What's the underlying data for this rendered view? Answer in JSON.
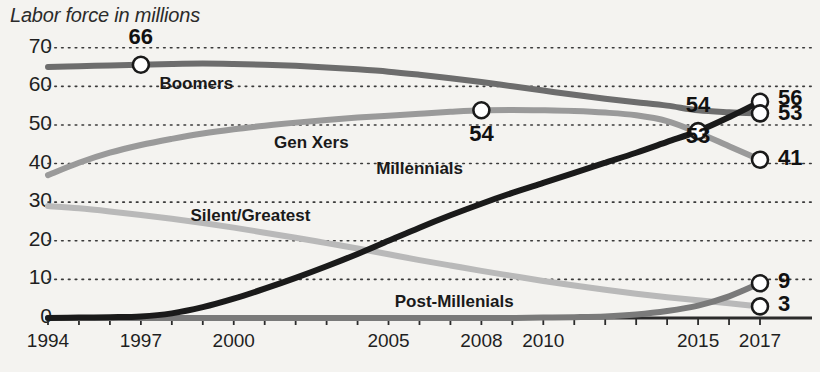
{
  "chart_data": {
    "type": "line",
    "title": "Labor force in millions",
    "xlabel": "",
    "ylabel": "",
    "xlim": [
      1994,
      2017
    ],
    "ylim": [
      0,
      72
    ],
    "grid": true,
    "grid_style": "dotted-horizontal",
    "legend": "inline-labels",
    "x": [
      1994,
      1995,
      1996,
      1997,
      1998,
      1999,
      2000,
      2001,
      2002,
      2003,
      2004,
      2005,
      2006,
      2007,
      2008,
      2009,
      2010,
      2011,
      2012,
      2013,
      2014,
      2015,
      2016,
      2017
    ],
    "x_tick_labels": [
      "1994",
      "1997",
      "2000",
      "2005",
      "2008",
      "2010",
      "2015",
      "2017"
    ],
    "x_tick_values": [
      1994,
      1997,
      2000,
      2005,
      2008,
      2010,
      2015,
      2017
    ],
    "y_tick_labels": [
      "0",
      "10",
      "20",
      "30",
      "40",
      "50",
      "60",
      "70"
    ],
    "y_tick_values": [
      0,
      10,
      20,
      30,
      40,
      50,
      60,
      70
    ],
    "series": [
      {
        "name": "Boomers",
        "color": "#6d6d6d",
        "label_x": 1997.6,
        "label_y": 60.5,
        "values": [
          65.0,
          65.2,
          65.4,
          65.6,
          65.8,
          65.9,
          65.8,
          65.6,
          65.3,
          64.9,
          64.4,
          63.8,
          63.0,
          62.1,
          61.1,
          60.0,
          58.9,
          57.8,
          56.8,
          55.9,
          55.0,
          53.8,
          53.3,
          53.0
        ]
      },
      {
        "name": "Gen Xers",
        "color": "#9a9a9a",
        "label_x": 2001.3,
        "label_y": 45.2,
        "values": [
          37.0,
          40.2,
          42.8,
          44.8,
          46.4,
          47.8,
          48.9,
          49.8,
          50.6,
          51.3,
          51.9,
          52.4,
          52.9,
          53.4,
          53.8,
          53.9,
          53.8,
          53.6,
          53.2,
          52.5,
          51.0,
          48.0,
          44.5,
          41.0
        ]
      },
      {
        "name": "Millennials",
        "color": "#1a1a1a",
        "label_x": 2004.6,
        "label_y": 38.5,
        "values": [
          0.0,
          0.1,
          0.2,
          0.4,
          1.2,
          2.8,
          5.0,
          7.6,
          10.4,
          13.4,
          16.6,
          20.0,
          23.4,
          26.6,
          29.6,
          32.4,
          35.0,
          37.6,
          40.2,
          42.8,
          45.6,
          48.4,
          52.0,
          56.0
        ]
      },
      {
        "name": "Silent/Greatest",
        "color": "#b9b9b9",
        "label_x": 1998.6,
        "label_y": 26.5,
        "values": [
          29.0,
          28.4,
          27.6,
          26.7,
          25.7,
          24.6,
          23.4,
          22.1,
          20.8,
          19.4,
          18.0,
          16.5,
          15.0,
          13.6,
          12.2,
          10.9,
          9.6,
          8.4,
          7.3,
          6.3,
          5.4,
          4.6,
          3.8,
          3.0
        ]
      },
      {
        "name": "Post-Millenials",
        "color": "#7a7a7a",
        "label_x": 2005.2,
        "label_y": 4.2,
        "values": [
          0.0,
          0.0,
          0.0,
          0.0,
          0.0,
          0.0,
          0.0,
          0.0,
          0.0,
          0.0,
          0.0,
          0.0,
          0.0,
          0.0,
          0.0,
          0.0,
          0.1,
          0.2,
          0.4,
          0.9,
          1.8,
          3.2,
          5.6,
          9.0
        ]
      }
    ],
    "annotations": [
      {
        "id": "boomers-1997",
        "text": "66",
        "x": 1997,
        "y": 65.6,
        "marker": true,
        "label_dx": 0,
        "label_dy": -26,
        "align": "center"
      },
      {
        "id": "genx-2008",
        "text": "54",
        "x": 2008,
        "y": 53.8,
        "marker": true,
        "label_dx": 0,
        "label_dy": 26,
        "align": "center"
      },
      {
        "id": "millennials-2015",
        "text": "54",
        "x": 2015,
        "y": 48.4,
        "marker": true,
        "label_dx": 0,
        "label_dy": -24,
        "align": "center"
      },
      {
        "id": "boomers-2015",
        "text": "53",
        "x": 2015,
        "y": 53.8,
        "marker": false,
        "label_dx": 0,
        "label_dy": 28,
        "align": "center"
      },
      {
        "id": "millennials-2017",
        "text": "56",
        "x": 2017,
        "y": 56.0,
        "marker": true,
        "label_dx": 18,
        "label_dy": -2,
        "align": "left"
      },
      {
        "id": "boomers-2017",
        "text": "53",
        "x": 2017,
        "y": 53.0,
        "marker": true,
        "label_dx": 18,
        "label_dy": 2,
        "align": "left"
      },
      {
        "id": "genx-2017",
        "text": "41",
        "x": 2017,
        "y": 41.0,
        "marker": true,
        "label_dx": 18,
        "label_dy": 0,
        "align": "left"
      },
      {
        "id": "postmillennials-2017",
        "text": "9",
        "x": 2017,
        "y": 9.0,
        "marker": true,
        "label_dx": 18,
        "label_dy": 0,
        "align": "left"
      },
      {
        "id": "silent-2017",
        "text": "3",
        "x": 2017,
        "y": 3.0,
        "marker": true,
        "label_dx": 18,
        "label_dy": 0,
        "align": "left"
      }
    ]
  }
}
